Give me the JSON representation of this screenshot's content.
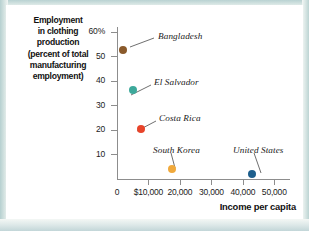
{
  "chart_data": {
    "type": "scatter",
    "title": "",
    "xlabel": "Income per capita",
    "ylabel": "Employment in clothing production (percent of total manufacturing employment)",
    "ylabel_lines": [
      "Employment",
      "in clothing",
      "production",
      "(percent of total",
      "manufacturing",
      "employment)"
    ],
    "xlim": [
      0,
      55000
    ],
    "ylim": [
      0,
      62
    ],
    "grid": false,
    "legend": "none",
    "x_ticks": [
      {
        "value": 0,
        "label": "0"
      },
      {
        "value": 10000,
        "label": "$10,000"
      },
      {
        "value": 20000,
        "label": "20,000"
      },
      {
        "value": 30000,
        "label": "30,000"
      },
      {
        "value": 40000,
        "label": "40,000"
      },
      {
        "value": 50000,
        "label": "50,000"
      }
    ],
    "y_ticks": [
      {
        "value": 60,
        "label": "60%"
      },
      {
        "value": 50,
        "label": "50"
      },
      {
        "value": 40,
        "label": "40"
      },
      {
        "value": 30,
        "label": "30"
      },
      {
        "value": 20,
        "label": "20"
      },
      {
        "value": 10,
        "label": "10"
      }
    ],
    "points": [
      {
        "name": "Bangladesh",
        "x": 2000,
        "y": 52.5,
        "color": "#8a5a2b",
        "label_x": 152,
        "label_y": 26,
        "leader": {
          "x1": 148,
          "y1": 33,
          "x2": 124,
          "y2": 42
        }
      },
      {
        "name": "El Salvador",
        "x": 5000,
        "y": 36.5,
        "color": "#3da99b",
        "label_x": 148,
        "label_y": 72,
        "leader": {
          "x1": 145,
          "y1": 80,
          "x2": 125,
          "y2": 90
        }
      },
      {
        "name": "Costa Rica",
        "x": 7500,
        "y": 20.5,
        "color": "#e8442a",
        "label_x": 153,
        "label_y": 108,
        "leader": {
          "x1": 150,
          "y1": 116,
          "x2": 131,
          "y2": 126
        }
      },
      {
        "name": "South Korea",
        "x": 17500,
        "y": 4.0,
        "color": "#f0a93c",
        "label_x": 147,
        "label_y": 140,
        "leader": {
          "x1": 165,
          "y1": 148,
          "x2": 169,
          "y2": 163
        }
      },
      {
        "name": "United States",
        "x": 43000,
        "y": 2.0,
        "color": "#1d5e8c",
        "label_x": 227,
        "label_y": 140,
        "leader": {
          "x1": 248,
          "y1": 148,
          "x2": 255,
          "y2": 168
        }
      }
    ]
  }
}
